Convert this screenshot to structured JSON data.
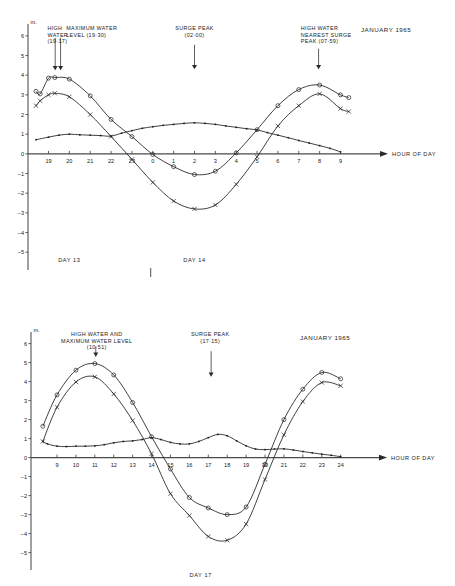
{
  "chart_data": [
    {
      "id": "top",
      "type": "line",
      "title": "JANUARY 1965",
      "xlabel": "HOUR OF DAY",
      "ylabel": "m.",
      "ylim": [
        -5.6,
        6.4
      ],
      "xlim": [
        18.4,
        9.6
      ],
      "yticks": [
        6,
        5,
        4,
        3,
        2,
        1,
        0,
        -1,
        -2,
        -3,
        -4,
        -5
      ],
      "xticks": [
        19,
        20,
        21,
        22,
        23,
        0,
        1,
        2,
        3,
        4,
        5,
        6,
        7,
        8,
        9
      ],
      "xticklabels": [
        "19",
        "20",
        "21",
        "22",
        "23",
        "0",
        "1",
        "2",
        "3",
        "4",
        "5",
        "6",
        "7",
        "8",
        "9"
      ],
      "grid": false,
      "day_labels": [
        {
          "text": "DAY 13",
          "x": 20.0
        },
        {
          "text": "DAY 14",
          "x": 2.0
        }
      ],
      "day_separator_x": 23.9,
      "annotations": [
        {
          "name": "high-water",
          "lines": [
            "HIGH",
            "WATER",
            "(19·17)"
          ],
          "text_x": 18.95,
          "arrow_x": 19.32,
          "arrow_y_top": 5.9,
          "arrow_y_bottom": 4.25
        },
        {
          "name": "maximum-water-level",
          "lines": [
            "MAXIMUM WATER",
            "LEVEL (19·30)"
          ],
          "text_x": 19.85,
          "arrow_x": 19.58,
          "arrow_y_top": 5.9,
          "arrow_y_bottom": 4.25
        },
        {
          "name": "surge-peak",
          "lines": [
            "SURGE PEAK",
            "(02·00)"
          ],
          "text_x": 2.0,
          "arrow_x": 2.0,
          "arrow_y_top": 5.55,
          "arrow_y_bottom": 4.3
        },
        {
          "name": "high-water-nearest-surge-peak",
          "lines": [
            "HIGH WATER",
            "NEAREST SURGE",
            "PEAK (07·59)"
          ],
          "text_x": 7.1,
          "arrow_x": 7.95,
          "arrow_y_top": 5.35,
          "arrow_y_bottom": 4.3
        }
      ],
      "series": [
        {
          "name": "observed-water-level",
          "marker": "circle",
          "x": [
            18.4,
            18.6,
            19.0,
            19.3,
            20.0,
            21.0,
            22.0,
            23.0,
            0.0,
            1.0,
            2.0,
            3.0,
            4.0,
            5.0,
            6.0,
            7.0,
            8.0,
            9.0,
            9.4
          ],
          "values": [
            3.18,
            3.05,
            3.85,
            3.88,
            3.8,
            2.95,
            1.75,
            0.88,
            -0.03,
            -0.65,
            -1.05,
            -0.88,
            0.05,
            1.23,
            2.45,
            3.27,
            3.5,
            3.0,
            2.86
          ]
        },
        {
          "name": "predicted-tide",
          "marker": "cross",
          "x": [
            18.4,
            18.6,
            19.0,
            19.3,
            20.0,
            21.0,
            22.0,
            23.0,
            0.0,
            1.0,
            2.0,
            3.0,
            4.0,
            5.0,
            6.0,
            7.0,
            8.0,
            9.0,
            9.4
          ],
          "values": [
            2.45,
            2.7,
            3.0,
            3.08,
            2.9,
            2.0,
            0.88,
            -0.28,
            -1.45,
            -2.4,
            -2.8,
            -2.6,
            -1.55,
            -0.15,
            1.42,
            2.45,
            3.05,
            2.3,
            2.15
          ]
        },
        {
          "name": "surge-residual",
          "marker": "dot",
          "x": [
            18.4,
            19.0,
            19.5,
            20.0,
            20.5,
            21.0,
            21.5,
            22.0,
            22.5,
            23.0,
            23.5,
            0.0,
            0.5,
            1.0,
            1.5,
            2.0,
            2.5,
            3.0,
            3.5,
            4.0,
            4.5,
            5.0,
            5.5,
            6.0,
            6.5,
            7.0,
            7.5,
            8.0,
            8.5,
            9.0
          ],
          "values": [
            0.72,
            0.85,
            0.95,
            1.0,
            0.97,
            0.95,
            0.93,
            0.9,
            1.05,
            1.18,
            1.3,
            1.38,
            1.45,
            1.5,
            1.55,
            1.58,
            1.55,
            1.5,
            1.42,
            1.35,
            1.28,
            1.22,
            1.08,
            0.95,
            0.82,
            0.68,
            0.55,
            0.42,
            0.28,
            0.1
          ]
        }
      ]
    },
    {
      "id": "bottom",
      "type": "line",
      "title": "JANUARY 1965",
      "xlabel": "HOUR OF DAY",
      "ylabel": "m.",
      "ylim": [
        -5.6,
        6.4
      ],
      "xlim": [
        8.1,
        24.6
      ],
      "yticks": [
        6,
        5,
        4,
        3,
        2,
        1,
        0,
        -1,
        -2,
        -3,
        -4,
        -5
      ],
      "xticks": [
        9,
        10,
        11,
        12,
        13,
        14,
        15,
        16,
        17,
        18,
        19,
        20,
        21,
        22,
        23,
        24
      ],
      "xticklabels": [
        "9",
        "10",
        "11",
        "12",
        "13",
        "14",
        "15",
        "16",
        "17",
        "18",
        "19",
        "20",
        "21",
        "22",
        "23",
        "24"
      ],
      "grid": false,
      "day_labels": [
        {
          "text": "DAY 17",
          "x": 16.6
        }
      ],
      "day_separator_x": null,
      "annotations": [
        {
          "name": "high-water-and-maximum-water-level",
          "lines": [
            "HIGH WATER AND",
            "MAXIMUM WATER LEVEL",
            "(10·51)"
          ],
          "text_x": 11.1,
          "arrow_x": 11.05,
          "arrow_y_top": 5.85,
          "arrow_y_bottom": 5.3
        },
        {
          "name": "surge-peak",
          "lines": [
            "SURGE PEAK",
            "(17·15)"
          ],
          "text_x": 17.1,
          "arrow_x": 17.15,
          "arrow_y_top": 5.6,
          "arrow_y_bottom": 4.25
        }
      ],
      "series": [
        {
          "name": "observed-water-level",
          "marker": "circle",
          "x": [
            8.25,
            9.0,
            10.0,
            11.0,
            12.0,
            13.0,
            14.0,
            15.0,
            16.0,
            17.0,
            18.0,
            19.0,
            20.0,
            21.0,
            22.0,
            23.0,
            24.0
          ],
          "values": [
            1.65,
            3.3,
            4.6,
            4.95,
            4.35,
            2.9,
            1.1,
            -0.6,
            -2.1,
            -2.65,
            -3.0,
            -2.6,
            -0.35,
            2.0,
            3.6,
            4.48,
            4.15
          ]
        },
        {
          "name": "predicted-tide",
          "marker": "cross",
          "x": [
            8.25,
            9.0,
            10.0,
            11.0,
            12.0,
            13.0,
            14.0,
            15.0,
            16.0,
            17.0,
            18.0,
            19.0,
            20.0,
            21.0,
            22.0,
            23.0,
            24.0
          ],
          "values": [
            0.85,
            2.65,
            3.98,
            4.25,
            3.35,
            1.95,
            0.2,
            -1.9,
            -3.05,
            -4.15,
            -4.35,
            -3.5,
            -1.15,
            1.2,
            2.95,
            3.95,
            3.78
          ]
        },
        {
          "name": "surge-residual",
          "marker": "dot",
          "x": [
            8.25,
            8.5,
            9.0,
            9.5,
            10.0,
            10.5,
            11.0,
            11.5,
            12.0,
            12.5,
            13.0,
            13.5,
            14.0,
            14.5,
            15.0,
            15.5,
            16.0,
            16.5,
            17.0,
            17.5,
            18.0,
            18.5,
            19.0,
            19.5,
            20.0,
            20.5,
            21.0,
            21.5,
            22.0,
            22.5,
            23.0,
            23.5,
            24.0
          ],
          "values": [
            0.85,
            0.72,
            0.6,
            0.58,
            0.6,
            0.6,
            0.62,
            0.68,
            0.78,
            0.85,
            0.88,
            0.95,
            1.05,
            0.95,
            0.8,
            0.72,
            0.72,
            0.85,
            1.05,
            1.22,
            1.15,
            0.88,
            0.62,
            0.45,
            0.42,
            0.45,
            0.46,
            0.4,
            0.32,
            0.25,
            0.18,
            0.12,
            0.05
          ]
        }
      ]
    }
  ]
}
